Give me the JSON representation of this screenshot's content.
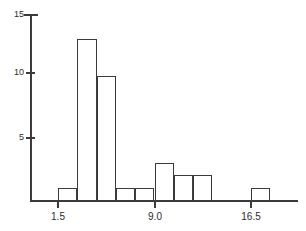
{
  "chart_data": {
    "type": "bar",
    "title": "",
    "subtitle": "",
    "xlabel": "",
    "ylabel": "",
    "grid": false,
    "legend": null,
    "bin_width": 1.5,
    "bin_edges": [
      1.5,
      3.0,
      4.5,
      6.0,
      7.5,
      9.0,
      10.5,
      12.0,
      13.5,
      15.0,
      16.5,
      18.0
    ],
    "categories": [
      "1.5-3.0",
      "3.0-4.5",
      "4.5-6.0",
      "6.0-7.5",
      "7.5-9.0",
      "9.0-10.5",
      "10.5-12.0",
      "12.0-13.5",
      "13.5-15.0",
      "15.0-16.5",
      "16.5-18.0"
    ],
    "values": [
      1,
      13,
      10,
      1,
      1,
      3,
      2,
      2,
      0,
      0,
      1
    ],
    "xlim": [
      0.0,
      19.5
    ],
    "ylim": [
      0,
      15
    ],
    "xticks": [
      1.5,
      9.0,
      16.5
    ],
    "xtick_labels": [
      "1.5",
      "9.0",
      "16.5"
    ],
    "yticks": [
      5,
      10,
      15
    ],
    "ytick_labels": [
      "5",
      "10",
      "15"
    ]
  },
  "style": {
    "line_color": "#3b3b3b",
    "bar_fill": "#ffffff",
    "text_color": "#2b2b2b",
    "background": "#ffffff"
  }
}
